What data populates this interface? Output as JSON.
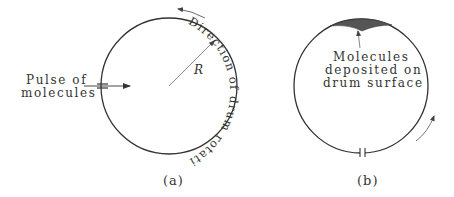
{
  "figure": {
    "panel_a": {
      "caption": "(a)",
      "pulse_label_line1": "Pulse of",
      "pulse_label_line2": "molecules",
      "radius_label": "R",
      "rotation_label": "Direction of drum rotation"
    },
    "panel_b": {
      "caption": "(b)",
      "deposit_label_line1": "Molecules",
      "deposit_label_line2": "deposited on",
      "deposit_label_line3": "drum surface"
    },
    "colors": {
      "line": "#333333",
      "deposit": "#555555",
      "background": "#ffffff"
    }
  }
}
